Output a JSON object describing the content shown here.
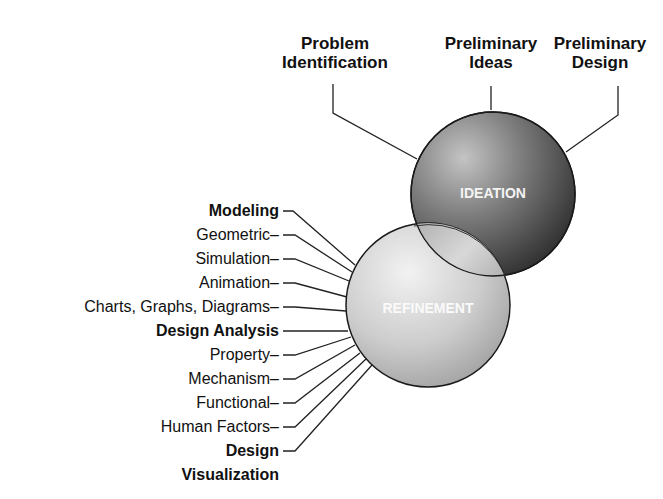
{
  "diagram": {
    "type": "overlapping-spheres",
    "spheres": [
      {
        "id": "ideation",
        "label": "IDEATION",
        "shade": "dark"
      },
      {
        "id": "refinement",
        "label": "REFINEMENT",
        "shade": "light"
      }
    ],
    "ideation_inputs": [
      {
        "label": "Problem Identification",
        "line1": "Problem",
        "line2": "Identification"
      },
      {
        "label": "Preliminary Ideas",
        "line1": "Preliminary",
        "line2": "Ideas"
      },
      {
        "label": "Preliminary Design",
        "line1": "Preliminary",
        "line2": "Design"
      }
    ],
    "refinement_items": [
      {
        "label": "Modeling",
        "bold": true
      },
      {
        "label": "Geometric–",
        "bold": false
      },
      {
        "label": "Simulation–",
        "bold": false
      },
      {
        "label": "Animation–",
        "bold": false
      },
      {
        "label": "Charts, Graphs, Diagrams–",
        "bold": false
      },
      {
        "label": "Design Analysis",
        "bold": true
      },
      {
        "label": "Property–",
        "bold": false
      },
      {
        "label": "Mechanism–",
        "bold": false
      },
      {
        "label": "Functional–",
        "bold": false
      },
      {
        "label": "Human Factors–",
        "bold": false
      },
      {
        "label": "Design",
        "bold": true
      },
      {
        "label": "Visualization",
        "bold": true
      }
    ],
    "colors": {
      "ideation_dark": "#3a3a3a",
      "ideation_light": "#b8b8b8",
      "refinement_dark": "#9a9a9a",
      "refinement_light": "#eeeeee",
      "line": "#222222",
      "text": "#111111"
    }
  }
}
